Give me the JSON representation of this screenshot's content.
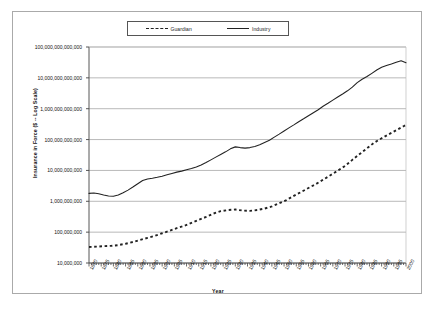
{
  "chart_data": {
    "type": "line",
    "title": "",
    "xlabel": "Year",
    "ylabel": "Insurance in Force ($ -- Log Scale)",
    "grid": true,
    "legend_position": "top-center",
    "yscale": "log",
    "ylim": [
      10000000,
      100000000000000
    ],
    "xlim": [
      1870,
      2000
    ],
    "ytick_labels": [
      "100,000,000,000,000",
      "10,000,000,000,000",
      "1,000,000,000,000",
      "100,000,000,000",
      "10,000,000,000",
      "1,000,000,000",
      "100,000,000",
      "10,000,000"
    ],
    "ytick_values": [
      100000000000000,
      10000000000000,
      1000000000000,
      100000000000,
      10000000000,
      1000000000,
      100000000,
      10000000
    ],
    "xtick_labels": [
      "1870",
      "1875",
      "1880",
      "1885",
      "1890",
      "1895",
      "1900",
      "1905",
      "1910",
      "1915",
      "1920",
      "1925",
      "1930",
      "1935",
      "1940",
      "1945",
      "1950",
      "1955",
      "1960",
      "1965",
      "1970",
      "1975",
      "1980",
      "1985",
      "1990",
      "1995",
      "2000"
    ],
    "xtick_values": [
      1870,
      1875,
      1880,
      1885,
      1890,
      1895,
      1900,
      1905,
      1910,
      1915,
      1920,
      1925,
      1930,
      1935,
      1940,
      1945,
      1950,
      1955,
      1960,
      1965,
      1970,
      1975,
      1980,
      1985,
      1990,
      1995,
      2000
    ],
    "series": [
      {
        "name": "Guardian",
        "style": "dashed",
        "color": "#222222",
        "x": [
          1870,
          1873,
          1876,
          1879,
          1882,
          1885,
          1888,
          1891,
          1894,
          1897,
          1900,
          1903,
          1906,
          1909,
          1912,
          1915,
          1918,
          1921,
          1924,
          1927,
          1930,
          1933,
          1936,
          1939,
          1942,
          1945,
          1948,
          1951,
          1954,
          1957,
          1960,
          1963,
          1966,
          1969,
          1972,
          1975,
          1978,
          1981,
          1984,
          1987,
          1990,
          1993,
          1996,
          1999,
          2000
        ],
        "y": [
          33000000,
          34000000,
          35000000,
          36000000,
          38000000,
          42000000,
          48000000,
          56000000,
          65000000,
          76000000,
          92000000,
          110000000,
          135000000,
          160000000,
          200000000,
          250000000,
          310000000,
          400000000,
          480000000,
          520000000,
          540000000,
          500000000,
          490000000,
          520000000,
          580000000,
          680000000,
          860000000,
          1100000000,
          1500000000,
          2000000000,
          2700000000,
          3600000000,
          5000000000,
          7000000000,
          9800000000,
          14000000000,
          22000000000,
          34000000000,
          52000000000,
          80000000000,
          110000000000,
          150000000000,
          200000000000,
          270000000000,
          300000000000
        ]
      },
      {
        "name": "Industry",
        "style": "solid",
        "color": "#222222",
        "x": [
          1870,
          1872,
          1874,
          1876,
          1878,
          1880,
          1882,
          1884,
          1886,
          1888,
          1890,
          1892,
          1894,
          1896,
          1898,
          1900,
          1902,
          1904,
          1906,
          1908,
          1910,
          1912,
          1914,
          1916,
          1918,
          1920,
          1922,
          1924,
          1926,
          1928,
          1930,
          1932,
          1934,
          1936,
          1938,
          1940,
          1942,
          1944,
          1946,
          1948,
          1950,
          1952,
          1954,
          1956,
          1958,
          1960,
          1962,
          1964,
          1966,
          1968,
          1970,
          1972,
          1974,
          1976,
          1978,
          1980,
          1982,
          1984,
          1986,
          1988,
          1990,
          1992,
          1994,
          1996,
          1998,
          2000
        ],
        "y": [
          1800000000,
          1850000000,
          1750000000,
          1600000000,
          1480000000,
          1450000000,
          1600000000,
          1900000000,
          2300000000,
          2900000000,
          3700000000,
          4700000000,
          5300000000,
          5600000000,
          6000000000,
          6500000000,
          7200000000,
          8000000000,
          8800000000,
          9500000000,
          10500000000,
          11500000000,
          13000000000,
          15000000000,
          18000000000,
          22000000000,
          27000000000,
          33000000000,
          40000000000,
          50000000000,
          58000000000,
          55000000000,
          53000000000,
          55000000000,
          60000000000,
          68000000000,
          80000000000,
          95000000000,
          120000000000,
          150000000000,
          190000000000,
          240000000000,
          300000000000,
          380000000000,
          470000000000,
          590000000000,
          740000000000,
          930000000000,
          1200000000000,
          1500000000000,
          1900000000000,
          2400000000000,
          3000000000000,
          3800000000000,
          5000000000000,
          7000000000000,
          9000000000000,
          11000000000000,
          14000000000000,
          18000000000000,
          22000000000000,
          25000000000000,
          28000000000000,
          32000000000000,
          36000000000000,
          31000000000000
        ]
      }
    ]
  },
  "legend": {
    "entries": [
      {
        "label": "Guardian",
        "style": "dashed"
      },
      {
        "label": "Industry",
        "style": "solid"
      }
    ]
  }
}
